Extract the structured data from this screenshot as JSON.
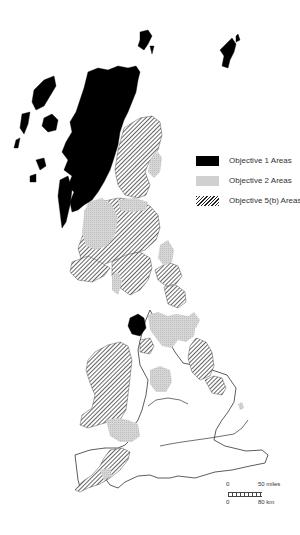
{
  "map": {
    "subject": "Great Britain EU structural fund objective areas",
    "legend": {
      "items": [
        {
          "id": "objective-1",
          "label": "Objective 1 Areas",
          "fill": "solid-black",
          "color": "#000000"
        },
        {
          "id": "objective-2",
          "label": "Objective 2 Areas",
          "fill": "light-grey-stipple",
          "color": "#d0d0d0"
        },
        {
          "id": "objective-5b",
          "label": "Objective 5(b) Areas",
          "fill": "diagonal-hatch",
          "color": "#222222"
        }
      ]
    },
    "scale_bar": {
      "miles_start": "0",
      "miles_end": "50 miles",
      "km_start": "0",
      "km_end": "80 km"
    },
    "colors": {
      "background": "#ffffff",
      "outline": "#333333",
      "objective_1": "#000000",
      "objective_2": "#d0d0d0",
      "objective_5b_hatch": "#222222"
    }
  }
}
